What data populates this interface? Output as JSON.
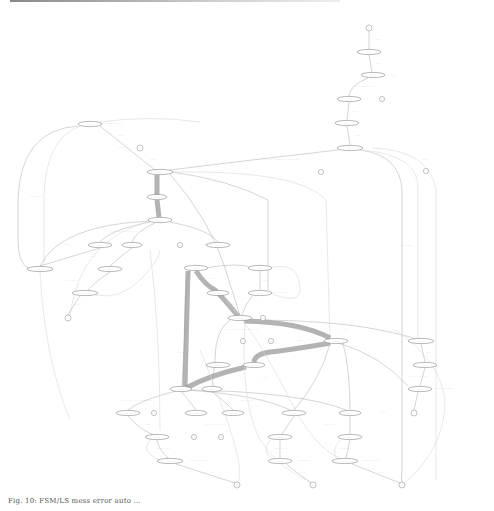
{
  "figure": {
    "type": "state-transition graph",
    "caption": "Fig. 10: FSM/LS mess error auto ...",
    "colors": {
      "background": "#ffffff",
      "node_stroke": "#8a8a8a",
      "edge": "#b8b8b8",
      "heavy_edge": "#9a9a9a",
      "text": "#444444"
    }
  },
  "nodes": [
    {
      "id": "n_start",
      "shape": "circle",
      "x": 369,
      "y": 28,
      "label": "..."
    },
    {
      "id": "n1",
      "shape": "ellipse",
      "x": 369,
      "y": 52,
      "label": "........"
    },
    {
      "id": "n2",
      "shape": "ellipse",
      "x": 373,
      "y": 75,
      "label": "........"
    },
    {
      "id": "n2t",
      "shape": "circle",
      "x": 382,
      "y": 99,
      "label": "..."
    },
    {
      "id": "n3",
      "shape": "ellipse",
      "x": 349,
      "y": 99,
      "label": "........"
    },
    {
      "id": "n4",
      "shape": "ellipse",
      "x": 347,
      "y": 123,
      "label": "........"
    },
    {
      "id": "n5",
      "shape": "ellipse",
      "x": 350,
      "y": 148,
      "label": "........"
    },
    {
      "id": "n5t",
      "shape": "circle",
      "x": 426,
      "y": 171,
      "label": "..."
    },
    {
      "id": "n5t2",
      "shape": "circle",
      "x": 321,
      "y": 172,
      "label": "..."
    },
    {
      "id": "n6",
      "shape": "ellipse",
      "x": 90,
      "y": 124,
      "label": "........"
    },
    {
      "id": "n6t",
      "shape": "circle",
      "x": 140,
      "y": 148,
      "label": "..."
    },
    {
      "id": "n7",
      "shape": "ellipse",
      "x": 160,
      "y": 172,
      "label": "........"
    },
    {
      "id": "n8",
      "shape": "ellipse",
      "x": 157,
      "y": 197,
      "label": "........"
    },
    {
      "id": "n9",
      "shape": "ellipse",
      "x": 160,
      "y": 220,
      "label": "........"
    },
    {
      "id": "n10",
      "shape": "ellipse",
      "x": 100,
      "y": 245,
      "label": "........"
    },
    {
      "id": "n11",
      "shape": "ellipse",
      "x": 132,
      "y": 245,
      "label": "........"
    },
    {
      "id": "n12",
      "shape": "ellipse",
      "x": 218,
      "y": 245,
      "label": "........"
    },
    {
      "id": "n12t",
      "shape": "circle",
      "x": 180,
      "y": 245,
      "label": "..."
    },
    {
      "id": "n13",
      "shape": "ellipse",
      "x": 40,
      "y": 269,
      "label": "........"
    },
    {
      "id": "n14",
      "shape": "ellipse",
      "x": 110,
      "y": 269,
      "label": "........"
    },
    {
      "id": "n15",
      "shape": "ellipse",
      "x": 85,
      "y": 293,
      "label": "........"
    },
    {
      "id": "n15t",
      "shape": "circle",
      "x": 68,
      "y": 318,
      "label": "..."
    },
    {
      "id": "n16",
      "shape": "ellipse",
      "x": 196,
      "y": 268,
      "label": "........"
    },
    {
      "id": "n17",
      "shape": "ellipse",
      "x": 260,
      "y": 268,
      "label": "........"
    },
    {
      "id": "n18",
      "shape": "ellipse",
      "x": 260,
      "y": 293,
      "label": "........"
    },
    {
      "id": "n19",
      "shape": "ellipse",
      "x": 218,
      "y": 293,
      "label": "........"
    },
    {
      "id": "n20",
      "shape": "ellipse",
      "x": 240,
      "y": 318,
      "label": "........"
    },
    {
      "id": "n20t",
      "shape": "circle",
      "x": 263,
      "y": 318,
      "label": "..."
    },
    {
      "id": "n21",
      "shape": "circle",
      "x": 243,
      "y": 341,
      "label": "..."
    },
    {
      "id": "n22",
      "shape": "circle",
      "x": 271,
      "y": 341,
      "label": "..."
    },
    {
      "id": "n23",
      "shape": "ellipse",
      "x": 218,
      "y": 365,
      "label": "........"
    },
    {
      "id": "n24",
      "shape": "ellipse",
      "x": 254,
      "y": 365,
      "label": "........"
    },
    {
      "id": "n25",
      "shape": "ellipse",
      "x": 336,
      "y": 341,
      "label": "........"
    },
    {
      "id": "n26",
      "shape": "ellipse",
      "x": 421,
      "y": 341,
      "label": "........"
    },
    {
      "id": "n27",
      "shape": "ellipse",
      "x": 425,
      "y": 365,
      "label": "........"
    },
    {
      "id": "n28",
      "shape": "ellipse",
      "x": 420,
      "y": 389,
      "label": "........"
    },
    {
      "id": "n28t",
      "shape": "circle",
      "x": 414,
      "y": 413,
      "label": "..."
    },
    {
      "id": "n29",
      "shape": "ellipse",
      "x": 181,
      "y": 389,
      "label": "........"
    },
    {
      "id": "n30",
      "shape": "ellipse",
      "x": 212,
      "y": 389,
      "label": "........"
    },
    {
      "id": "n31",
      "shape": "ellipse",
      "x": 128,
      "y": 413,
      "label": "........"
    },
    {
      "id": "n31t",
      "shape": "circle",
      "x": 154,
      "y": 413,
      "label": "..."
    },
    {
      "id": "n32",
      "shape": "ellipse",
      "x": 196,
      "y": 413,
      "label": "........"
    },
    {
      "id": "n33",
      "shape": "ellipse",
      "x": 233,
      "y": 413,
      "label": "........"
    },
    {
      "id": "n34",
      "shape": "ellipse",
      "x": 294,
      "y": 413,
      "label": "........"
    },
    {
      "id": "n34b",
      "shape": "ellipse",
      "x": 350,
      "y": 413,
      "label": "........"
    },
    {
      "id": "n35",
      "shape": "ellipse",
      "x": 157,
      "y": 437,
      "label": "........"
    },
    {
      "id": "n35t",
      "shape": "circle",
      "x": 194,
      "y": 437,
      "label": "..."
    },
    {
      "id": "n35t2",
      "shape": "circle",
      "x": 221,
      "y": 437,
      "label": "..."
    },
    {
      "id": "n36",
      "shape": "ellipse",
      "x": 280,
      "y": 437,
      "label": "........"
    },
    {
      "id": "n37",
      "shape": "ellipse",
      "x": 350,
      "y": 437,
      "label": "........"
    },
    {
      "id": "n38",
      "shape": "ellipse",
      "x": 170,
      "y": 461,
      "label": "........"
    },
    {
      "id": "n39",
      "shape": "ellipse",
      "x": 280,
      "y": 461,
      "label": "........"
    },
    {
      "id": "n40",
      "shape": "ellipse",
      "x": 345,
      "y": 461,
      "label": "........"
    },
    {
      "id": "n41",
      "shape": "circle",
      "x": 237,
      "y": 485,
      "label": "..."
    },
    {
      "id": "n42",
      "shape": "circle",
      "x": 313,
      "y": 485,
      "label": "..."
    },
    {
      "id": "n43",
      "shape": "circle",
      "x": 402,
      "y": 485,
      "label": "..."
    }
  ],
  "edge_labels": [
    {
      "x": 375,
      "y": 40,
      "text": "........"
    },
    {
      "x": 375,
      "y": 64,
      "text": "........"
    },
    {
      "x": 392,
      "y": 76,
      "text": "...."
    },
    {
      "x": 354,
      "y": 87,
      "text": "........  .........  ........."
    },
    {
      "x": 352,
      "y": 112,
      "text": "........"
    },
    {
      "x": 355,
      "y": 136,
      "text": "........"
    },
    {
      "x": 265,
      "y": 160,
      "text": ".........  .........  .........  .........  ........"
    },
    {
      "x": 422,
      "y": 160,
      "text": "........"
    },
    {
      "x": 100,
      "y": 124,
      "text": "..........................."
    },
    {
      "x": 118,
      "y": 136,
      "text": "........"
    },
    {
      "x": 118,
      "y": 148,
      "text": "........"
    },
    {
      "x": 150,
      "y": 160,
      "text": "........"
    },
    {
      "x": 30,
      "y": 197,
      "text": "........   ........"
    },
    {
      "x": 110,
      "y": 232,
      "text": "........  ........  ........  ........"
    },
    {
      "x": 64,
      "y": 245,
      "text": "........"
    },
    {
      "x": 202,
      "y": 245,
      "text": "........  ........"
    },
    {
      "x": 400,
      "y": 246,
      "text": "........   ........"
    },
    {
      "x": 90,
      "y": 257,
      "text": "........"
    },
    {
      "x": 65,
      "y": 281,
      "text": "........  ........"
    },
    {
      "x": 75,
      "y": 305,
      "text": "........"
    },
    {
      "x": 210,
      "y": 279,
      "text": "........"
    },
    {
      "x": 230,
      "y": 305,
      "text": "........"
    },
    {
      "x": 270,
      "y": 293,
      "text": "........................"
    },
    {
      "x": 262,
      "y": 281,
      "text": "........"
    },
    {
      "x": 183,
      "y": 330,
      "text": "........"
    },
    {
      "x": 225,
      "y": 330,
      "text": "........  ........  ........  ........  ........"
    },
    {
      "x": 297,
      "y": 341,
      "text": "........"
    },
    {
      "x": 342,
      "y": 330,
      "text": "........"
    },
    {
      "x": 425,
      "y": 353,
      "text": "........"
    },
    {
      "x": 408,
      "y": 377,
      "text": "........  ........  ........"
    },
    {
      "x": 435,
      "y": 389,
      "text": "........................"
    },
    {
      "x": 380,
      "y": 413,
      "text": "........"
    },
    {
      "x": 178,
      "y": 353,
      "text": "........"
    },
    {
      "x": 262,
      "y": 378,
      "text": "........"
    },
    {
      "x": 120,
      "y": 401,
      "text": "........  ........  ........  ........  ........"
    },
    {
      "x": 240,
      "y": 401,
      "text": "........  ........"
    },
    {
      "x": 145,
      "y": 425,
      "text": "........"
    },
    {
      "x": 205,
      "y": 425,
      "text": ".........  ........  ........"
    },
    {
      "x": 324,
      "y": 425,
      "text": "........  ........"
    },
    {
      "x": 157,
      "y": 449,
      "text": "........  ........"
    },
    {
      "x": 274,
      "y": 449,
      "text": "........  ........"
    },
    {
      "x": 338,
      "y": 449,
      "text": "................"
    },
    {
      "x": 190,
      "y": 461,
      "text": "........................"
    },
    {
      "x": 298,
      "y": 461,
      "text": "................"
    },
    {
      "x": 362,
      "y": 461,
      "text": "........................"
    },
    {
      "x": 210,
      "y": 473,
      "text": "........"
    },
    {
      "x": 300,
      "y": 473,
      "text": "........"
    },
    {
      "x": 378,
      "y": 473,
      "text": "........"
    }
  ]
}
